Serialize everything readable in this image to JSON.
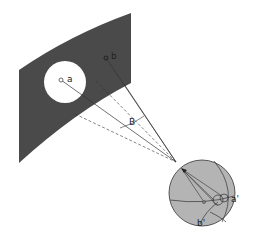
{
  "diagram": {
    "labels": {
      "a": "a",
      "b": "b",
      "angle": "B",
      "a_prime": "a'",
      "b_prime": "b'"
    },
    "colors": {
      "background": "#ffffff",
      "band": "#4a4a4a",
      "hole": "#ffffff",
      "sphere": "#b4b4b4",
      "lines": "#333333"
    }
  }
}
